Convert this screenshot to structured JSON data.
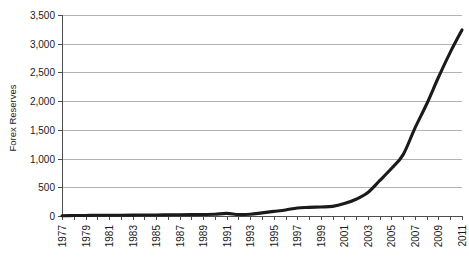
{
  "chart_data": {
    "type": "line",
    "title": "",
    "subtitle": "",
    "xlabel": "",
    "ylabel": "Forex Reserves",
    "ylim": [
      0,
      3500
    ],
    "xlim": [
      1977,
      2011
    ],
    "grid": true,
    "legend": false,
    "y_ticks": [
      0,
      500,
      1000,
      1500,
      2000,
      2500,
      3000,
      3500
    ],
    "y_tick_labels": [
      "0",
      "500",
      "1,000",
      "1,500",
      "2,000",
      "2,500",
      "3,000",
      "3,500"
    ],
    "x_ticks": [
      1977,
      1979,
      1981,
      1983,
      1985,
      1987,
      1989,
      1991,
      1993,
      1995,
      1997,
      1999,
      2001,
      2003,
      2005,
      2007,
      2009,
      2011
    ],
    "x_tick_labels": [
      "1977",
      "1979",
      "1981",
      "1983",
      "1985",
      "1987",
      "1989",
      "1991",
      "1993",
      "1995",
      "1997",
      "1999",
      "2001",
      "2003",
      "2005",
      "2007",
      "2009",
      "2011"
    ],
    "series": [
      {
        "name": "Forex Reserves",
        "color": "#1a1a1a",
        "x": [
          1977,
          1978,
          1979,
          1980,
          1981,
          1982,
          1983,
          1984,
          1985,
          1986,
          1987,
          1988,
          1989,
          1990,
          1991,
          1992,
          1993,
          1994,
          1995,
          1996,
          1997,
          1998,
          1999,
          2000,
          2001,
          2002,
          2003,
          2004,
          2005,
          2006,
          2007,
          2008,
          2009,
          2010,
          2011
        ],
        "values": [
          5,
          8,
          10,
          12,
          13,
          14,
          16,
          17,
          18,
          20,
          22,
          24,
          26,
          30,
          45,
          25,
          30,
          55,
          80,
          105,
          140,
          150,
          158,
          168,
          216,
          292,
          408,
          615,
          826,
          1069,
          1531,
          1950,
          2416,
          2850,
          3240
        ]
      }
    ]
  },
  "colors": {
    "grid": "#b3b3b3",
    "axis": "#4d4d4d",
    "line": "#1a1a1a",
    "background": "#ffffff"
  }
}
